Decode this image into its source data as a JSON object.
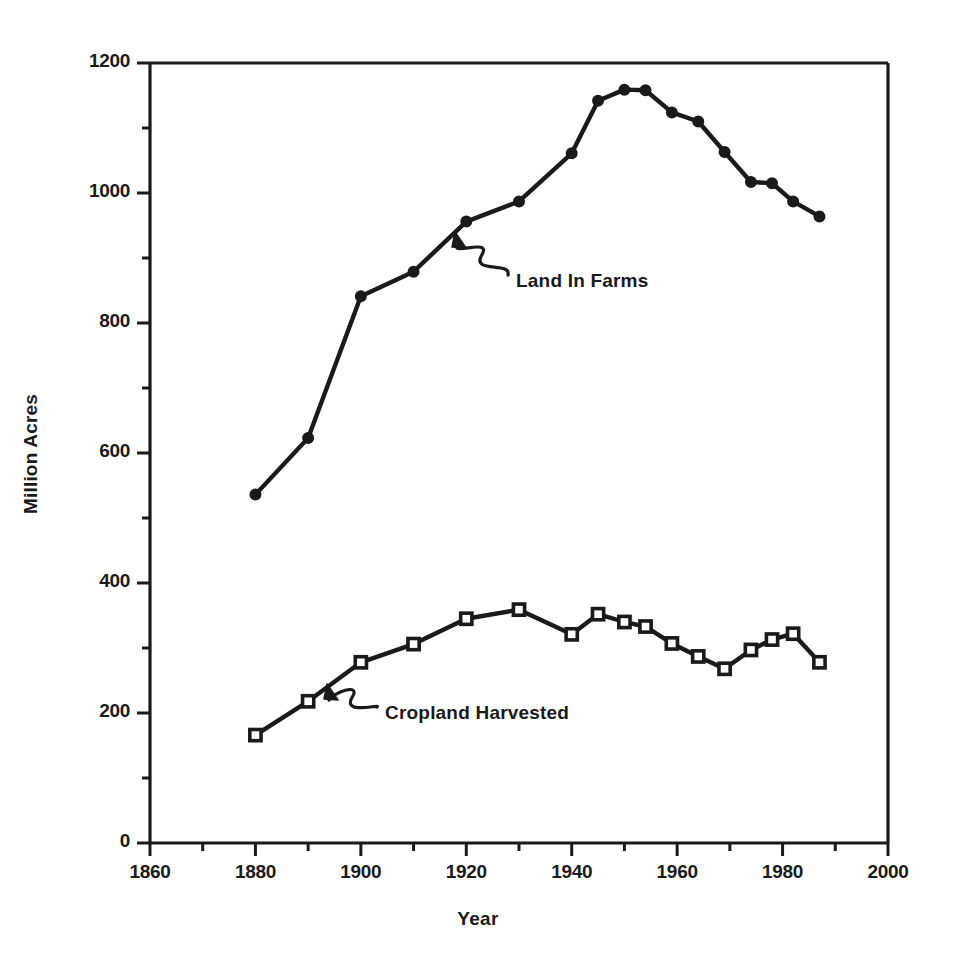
{
  "chart_data": {
    "type": "line",
    "title": "",
    "xlabel": "Year",
    "ylabel": "Million Acres",
    "xlim": [
      1860,
      2000
    ],
    "ylim": [
      0,
      1200
    ],
    "grid": false,
    "legend_position": "inline-annotations",
    "x_major_ticks": [
      1860,
      1880,
      1900,
      1920,
      1940,
      1960,
      1980,
      2000
    ],
    "x_minor_ticks": [
      1870,
      1890,
      1910,
      1930,
      1950,
      1970,
      1990
    ],
    "y_major_ticks": [
      0,
      200,
      400,
      600,
      800,
      1000,
      1200
    ],
    "y_minor_ticks": [
      100,
      300,
      500,
      700,
      900,
      1100
    ],
    "series": [
      {
        "name": "Land In Farms",
        "marker": "filled-circle",
        "color": "#1a1a1a",
        "points": [
          {
            "x": 1880,
            "y": 536
          },
          {
            "x": 1890,
            "y": 623
          },
          {
            "x": 1900,
            "y": 841
          },
          {
            "x": 1910,
            "y": 879
          },
          {
            "x": 1920,
            "y": 956
          },
          {
            "x": 1930,
            "y": 987
          },
          {
            "x": 1940,
            "y": 1061
          },
          {
            "x": 1945,
            "y": 1142
          },
          {
            "x": 1950,
            "y": 1159
          },
          {
            "x": 1954,
            "y": 1158
          },
          {
            "x": 1959,
            "y": 1124
          },
          {
            "x": 1964,
            "y": 1110
          },
          {
            "x": 1969,
            "y": 1063
          },
          {
            "x": 1974,
            "y": 1017
          },
          {
            "x": 1978,
            "y": 1015
          },
          {
            "x": 1982,
            "y": 987
          },
          {
            "x": 1987,
            "y": 964
          }
        ]
      },
      {
        "name": "Cropland Harvested",
        "marker": "open-square",
        "color": "#1a1a1a",
        "points": [
          {
            "x": 1880,
            "y": 166
          },
          {
            "x": 1890,
            "y": 218
          },
          {
            "x": 1900,
            "y": 278
          },
          {
            "x": 1910,
            "y": 306
          },
          {
            "x": 1920,
            "y": 345
          },
          {
            "x": 1930,
            "y": 359
          },
          {
            "x": 1940,
            "y": 321
          },
          {
            "x": 1945,
            "y": 352
          },
          {
            "x": 1950,
            "y": 340
          },
          {
            "x": 1954,
            "y": 333
          },
          {
            "x": 1959,
            "y": 307
          },
          {
            "x": 1964,
            "y": 287
          },
          {
            "x": 1969,
            "y": 268
          },
          {
            "x": 1974,
            "y": 297
          },
          {
            "x": 1978,
            "y": 313
          },
          {
            "x": 1982,
            "y": 322
          },
          {
            "x": 1987,
            "y": 278
          }
        ]
      }
    ],
    "annotations": [
      {
        "label": "Land In Farms",
        "text_x": 516,
        "text_y": 283,
        "arrow_tip_x": 455,
        "arrow_tip_y": 232
      },
      {
        "label": "Cropland Harvested",
        "text_x": 385,
        "text_y": 715,
        "arrow_tip_x": 327,
        "arrow_tip_y": 684
      }
    ]
  },
  "axis": {
    "y_title": "Million Acres",
    "x_title": "Year",
    "y_tick_labels": [
      "1200",
      "1000",
      "800",
      "600",
      "400",
      "200",
      "0"
    ],
    "x_tick_labels": [
      "1860",
      "1880",
      "1900",
      "1920",
      "1940",
      "1960",
      "1980",
      "2000"
    ]
  }
}
